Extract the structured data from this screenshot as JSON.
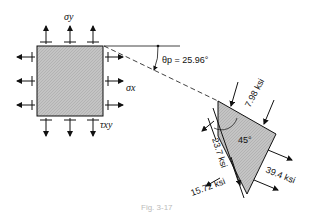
{
  "diagram": {
    "element": {
      "sigma_y_label": "σy",
      "sigma_x_label": "σx",
      "tau_xy_label": "τxy"
    },
    "angle": {
      "label": "θp = 25.96°",
      "theta_symbol": "θ",
      "theta_sub": "p",
      "value": "= 25.96°"
    },
    "wedge": {
      "inner_angle": "45°",
      "stress_top": "7.98 ksi",
      "stress_left": "23.7 ksi",
      "stress_bottom_left": "15.72 ksi",
      "stress_right": "39.4 ksi"
    },
    "caption": "Fig. 3-17",
    "colors": {
      "line": "#111111",
      "fill": "#c8c8c8"
    }
  }
}
